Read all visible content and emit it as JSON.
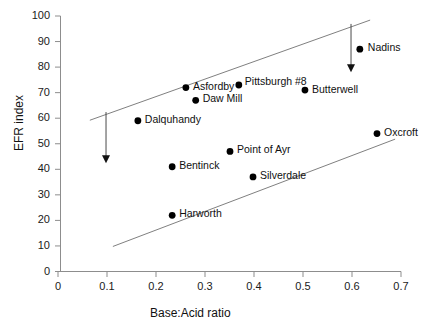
{
  "chart_data": {
    "type": "scatter",
    "title": "",
    "xlabel": "Base:Acid ratio",
    "ylabel": "EFR index",
    "xlim": [
      0,
      0.7
    ],
    "ylim": [
      0,
      100
    ],
    "xticks": [
      "0",
      "0.1",
      "0.2",
      "0.3",
      "0.4",
      "0.5",
      "0.6",
      "0.7"
    ],
    "yticks": [
      "0",
      "10",
      "20",
      "30",
      "40",
      "50",
      "60",
      "70",
      "80",
      "90",
      "100"
    ],
    "grid": false,
    "legend": "none",
    "marker_color": "#000000",
    "line_color": "#808080",
    "points": [
      {
        "label": "Dalquhandy",
        "x": 0.163,
        "y": 59,
        "label_dx": 7,
        "label_dy": -5
      },
      {
        "label": "Asfordby",
        "x": 0.261,
        "y": 72,
        "label_dx": 7,
        "label_dy": -5
      },
      {
        "label": "Daw Mill",
        "x": 0.281,
        "y": 67,
        "label_dx": 7,
        "label_dy": -5
      },
      {
        "label": "Pittsburgh #8",
        "x": 0.369,
        "y": 73,
        "label_dx": 6,
        "label_dy": -7
      },
      {
        "label": "Butterwell",
        "x": 0.504,
        "y": 71,
        "label_dx": 7,
        "label_dy": -4
      },
      {
        "label": "Nadins",
        "x": 0.616,
        "y": 87,
        "label_dx": 8,
        "label_dy": -5
      },
      {
        "label": "Oxcroft",
        "x": 0.651,
        "y": 54,
        "label_dx": 7,
        "label_dy": -5
      },
      {
        "label": "Point of Ayr",
        "x": 0.351,
        "y": 47,
        "label_dx": 7,
        "label_dy": -5
      },
      {
        "label": "Bentinck",
        "x": 0.233,
        "y": 41,
        "label_dx": 7,
        "label_dy": -5
      },
      {
        "label": "Silverdale",
        "x": 0.398,
        "y": 37,
        "label_dx": 7,
        "label_dy": -5
      },
      {
        "label": "Harworth",
        "x": 0.233,
        "y": 22,
        "label_dx": 7,
        "label_dy": -5
      }
    ],
    "trend_lines": [
      {
        "name": "upper-bound-line",
        "x1": 0.065,
        "y1": 59.2,
        "x2": 0.637,
        "y2": 98.4
      },
      {
        "name": "lower-bound-line",
        "x1": 0.112,
        "y1": 9.8,
        "x2": 0.688,
        "y2": 51.8
      }
    ],
    "annotations": [
      {
        "name": "left-down-arrow",
        "x": 0.098,
        "y_top": 62.4,
        "y_bottom": 42.4
      },
      {
        "name": "right-down-arrow",
        "x": 0.598,
        "y_top": 96.9,
        "y_bottom": 78.0
      }
    ]
  }
}
